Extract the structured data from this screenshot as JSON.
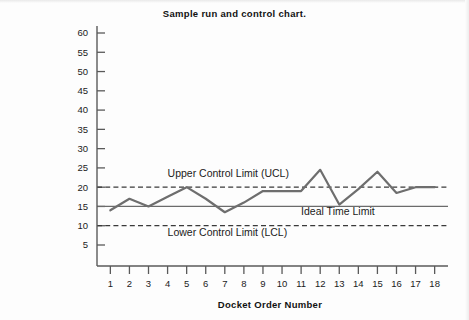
{
  "chart_data": {
    "type": "line",
    "title": "Sample run and control chart.",
    "xlabel": "Docket Order Number",
    "ylabel": "Time meal received after ordering (minutes)",
    "x": [
      1,
      2,
      3,
      4,
      5,
      6,
      7,
      8,
      9,
      10,
      11,
      12,
      13,
      14,
      15,
      16,
      17,
      18
    ],
    "xtick_labels": [
      "1",
      "2",
      "3",
      "4",
      "5",
      "6",
      "7",
      "8",
      "9",
      "10",
      "11",
      "12",
      "13",
      "14",
      "15",
      "16",
      "17",
      "18"
    ],
    "ytick_labels": [
      "5",
      "10",
      "15",
      "20",
      "25",
      "30",
      "35",
      "40",
      "45",
      "50",
      "55",
      "60"
    ],
    "yticks": [
      5,
      10,
      15,
      20,
      25,
      30,
      35,
      40,
      45,
      50,
      55,
      60
    ],
    "ylim": [
      0,
      62
    ],
    "xlim": [
      0.3,
      18.7
    ],
    "grid": false,
    "legend": "none",
    "series": [
      {
        "name": "Time meal received after ordering",
        "color": "#6e6e6e",
        "values": [
          14,
          17,
          15,
          17.5,
          20,
          17,
          13.5,
          16,
          19,
          19,
          19,
          24.5,
          15.5,
          19.5,
          24,
          18.5,
          20,
          20
        ]
      }
    ],
    "reference_lines": [
      {
        "name": "upper-control-limit",
        "label": "Upper Control Limit (UCL)",
        "value": 20,
        "style": "dashed",
        "color": "#3a3a3a",
        "label_x": 4.0,
        "label_y": 22.6
      },
      {
        "name": "ideal-time-limit",
        "label": "Ideal Time Limit",
        "value": 15,
        "style": "solid",
        "color": "#6b6b6b",
        "label_x": 11.0,
        "label_y": 12.7
      },
      {
        "name": "lower-control-limit",
        "label": "Lower Control Limit (LCL)",
        "value": 10,
        "style": "dashed",
        "color": "#3a3a3a",
        "label_x": 4.0,
        "label_y": 7.4
      }
    ],
    "axes": {
      "y_axis_color": "#5a5a5a",
      "x_axis_color": "#5a5a5a",
      "tick_color": "#5a5a5a"
    }
  }
}
